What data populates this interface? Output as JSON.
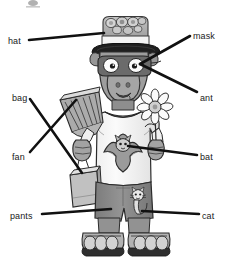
{
  "diagram": {
    "background_color": "#ffffff",
    "label_text_color": "#1a1a1a",
    "leader_line_color": "#111111",
    "artwork_style": "grayscale cartoon line art",
    "palette": {
      "outline": "#2b2b2b",
      "skin_gray": "#9a9a9a",
      "skin_gray_dark": "#7d7d7d",
      "shirt_white": "#f7f7f7",
      "pants_gray": "#8d8d8d",
      "hat_gray": "#b5b5b5",
      "hat_band_white": "#f2f2f2",
      "brim_black": "#232323",
      "mask_gray": "#6e6e6e",
      "sandal_gray": "#a8a8a8",
      "fan_gray": "#a0a0a0",
      "bag_gray": "#b8b8b8",
      "flower_white": "#fbfbfb"
    },
    "labels": [
      {
        "id": "hat",
        "text": "hat",
        "side": "left",
        "text_x": 8,
        "text_y": 36,
        "line_x1": 29,
        "line_y1": 40,
        "line_x2": 104,
        "line_y2": 33
      },
      {
        "id": "mask",
        "text": "mask",
        "side": "right",
        "text_x": 193,
        "text_y": 31,
        "line_x1": 190,
        "line_y1": 36,
        "line_x2": 140,
        "line_y2": 64
      },
      {
        "id": "ant",
        "text": "ant",
        "side": "right",
        "text_x": 200,
        "text_y": 93,
        "line_x1": 197,
        "line_y1": 92,
        "line_x2": 140,
        "line_y2": 64
      },
      {
        "id": "bag",
        "text": "bag",
        "side": "left",
        "text_x": 12,
        "text_y": 93,
        "line_x1": 30,
        "line_y1": 99,
        "line_x2": 82,
        "line_y2": 173
      },
      {
        "id": "fan",
        "text": "fan",
        "side": "left",
        "text_x": 12,
        "text_y": 152,
        "line_x1": 30,
        "line_y1": 152,
        "line_x2": 76,
        "line_y2": 100
      },
      {
        "id": "bat",
        "text": "bat",
        "side": "right",
        "text_x": 200,
        "text_y": 152,
        "line_x1": 197,
        "line_y1": 155,
        "line_x2": 128,
        "line_y2": 146
      },
      {
        "id": "pants",
        "text": "pants",
        "side": "left",
        "text_x": 10,
        "text_y": 211,
        "line_x1": 42,
        "line_y1": 214,
        "line_x2": 111,
        "line_y2": 209
      },
      {
        "id": "cat",
        "text": "cat",
        "side": "right",
        "text_x": 202,
        "text_y": 211,
        "line_x1": 199,
        "line_y1": 214,
        "line_x2": 142,
        "line_y2": 211
      }
    ],
    "figure_parts": [
      "hat with decorative badges on crown",
      "domino mask over eyes",
      "long aardvark snout",
      "white t-shirt with bat print",
      "fan held in left hand",
      "paper bag held in left hand",
      "daisy flower held in right hand",
      "gray shorts with cat print",
      "sandals with visible toes"
    ]
  }
}
